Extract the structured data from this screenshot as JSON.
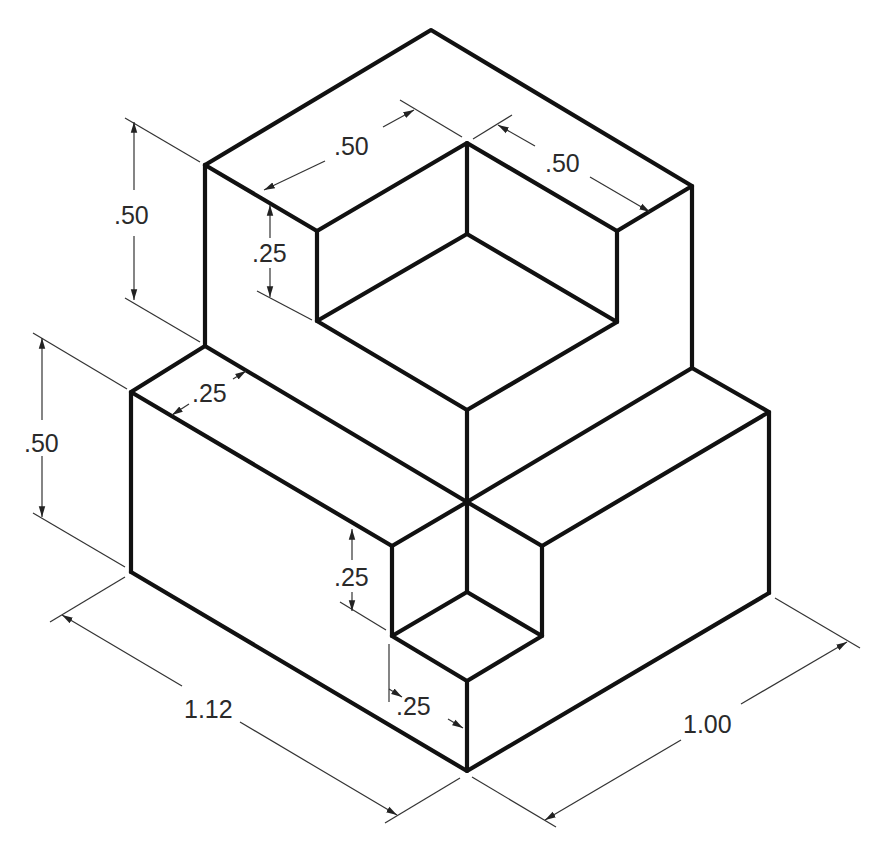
{
  "colors": {
    "edge": "#111111",
    "dimension": "#333333",
    "background": "#ffffff"
  },
  "dimensions": {
    "upper_height": ".50",
    "notch_top_left_width": ".50",
    "notch_top_right_width": ".50",
    "notch_top_depth": ".25",
    "lower_height": ".50",
    "ledge_width": ".25",
    "lower_notch_depth": ".25",
    "lower_notch_width": ".25",
    "overall_length": "1.12",
    "overall_width": "1.00"
  },
  "units": "inches"
}
